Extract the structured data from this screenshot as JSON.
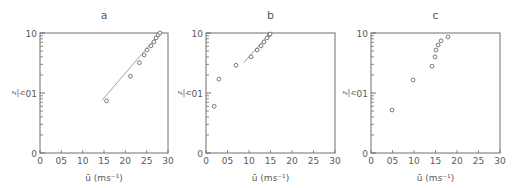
{
  "figure": {
    "colors": {
      "axis": "#6e6e6e",
      "marker": "#6a6a6a",
      "line": "#8a8a8a",
      "text": "#5a5a5a"
    }
  },
  "chart_data": [
    {
      "type": "scatter",
      "title": "a",
      "xlabel": "ū (ms⁻¹)",
      "ylabel": "z/h",
      "xlim": [
        0,
        3.0
      ],
      "ylim": [
        0.01,
        1.0
      ],
      "yscale": "log",
      "xticks": [
        "0",
        "0.5",
        "1.0",
        "1.5",
        "2.0",
        "2.5",
        "3.0"
      ],
      "xtick_labels_shown": [
        "0",
        "05",
        "10",
        "15",
        "20",
        "25",
        "30"
      ],
      "yticks": [
        "0",
        "0.1",
        "1.0"
      ],
      "ytick_labels_shown": [
        "0",
        "01",
        "10"
      ],
      "grid": false,
      "points": {
        "x": [
          1.56,
          2.12,
          2.33,
          2.44,
          2.51,
          2.6,
          2.67,
          2.72,
          2.77,
          2.81
        ],
        "y": [
          0.074,
          0.19,
          0.32,
          0.43,
          0.52,
          0.61,
          0.71,
          0.83,
          0.93,
          1.0
        ]
      },
      "fit_line": {
        "x": [
          1.45,
          2.81
        ],
        "y": [
          0.075,
          1.0
        ]
      }
    },
    {
      "type": "scatter",
      "title": "b",
      "xlabel": "ū (ms⁻¹)",
      "ylabel": "z/h",
      "xlim": [
        0,
        3.0
      ],
      "ylim": [
        0.01,
        1.0
      ],
      "yscale": "log",
      "xticks": [
        "0",
        "0.5",
        "1.0",
        "1.5",
        "2.0",
        "2.5",
        "3.0"
      ],
      "xtick_labels_shown": [
        "0",
        "05",
        "10",
        "15",
        "20",
        "25",
        "30"
      ],
      "yticks": [
        "0",
        "0.1",
        "1.0"
      ],
      "ytick_labels_shown": [
        "0",
        "01",
        "10"
      ],
      "grid": false,
      "points": {
        "x": [
          0.19,
          0.3,
          0.7,
          1.05,
          1.19,
          1.28,
          1.35,
          1.42,
          1.47,
          1.49
        ],
        "y": [
          0.06,
          0.17,
          0.29,
          0.4,
          0.52,
          0.61,
          0.71,
          0.83,
          0.93,
          0.96
        ]
      },
      "fit_line": {
        "x": [
          0.88,
          1.49
        ],
        "y": [
          0.32,
          1.0
        ]
      }
    },
    {
      "type": "scatter",
      "title": "c",
      "xlabel": "ū (ms⁻¹)",
      "ylabel": "z/h",
      "xlim": [
        0,
        3.0
      ],
      "ylim": [
        0.01,
        1.0
      ],
      "yscale": "log",
      "xticks": [
        "0",
        "0.5",
        "1.0",
        "1.5",
        "2.0",
        "2.5",
        "3.0"
      ],
      "xtick_labels_shown": [
        "0",
        "05",
        "10",
        "15",
        "20",
        "25",
        "30"
      ],
      "yticks": [
        "0",
        "0.1",
        "1.0"
      ],
      "ytick_labels_shown": [
        "0",
        "01",
        "10"
      ],
      "grid": false,
      "points": {
        "x": [
          0.49,
          0.98,
          1.42,
          1.49,
          1.51,
          1.56,
          1.63,
          1.79
        ],
        "y": [
          0.052,
          0.165,
          0.28,
          0.4,
          0.52,
          0.63,
          0.74,
          0.86
        ]
      },
      "fit_line": null
    }
  ]
}
